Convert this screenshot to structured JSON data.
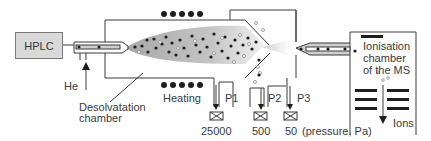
{
  "diagram": {
    "source_box": {
      "label": "HPLC"
    },
    "gas_inlet": {
      "label": "He"
    },
    "desolvation": {
      "label_line1": "Desolvatation",
      "label_line2": "chamber"
    },
    "heating": {
      "label": "Heating"
    },
    "ports": [
      {
        "label": "P1",
        "pressure": "25000"
      },
      {
        "label": "P2",
        "pressure": "500"
      },
      {
        "label": "P3",
        "pressure": "50"
      }
    ],
    "pressure_unit": "(pressure, Pa)",
    "ms_chamber": {
      "line1": "Ionisation",
      "line2": "chamber",
      "line3": "of the MS"
    },
    "ions_label": "Ions",
    "colors": {
      "line": "#3a3a3a",
      "plume": "#b8b8b8",
      "box_fill": "#d9d9d9",
      "dot": "#1e1e1e"
    }
  }
}
